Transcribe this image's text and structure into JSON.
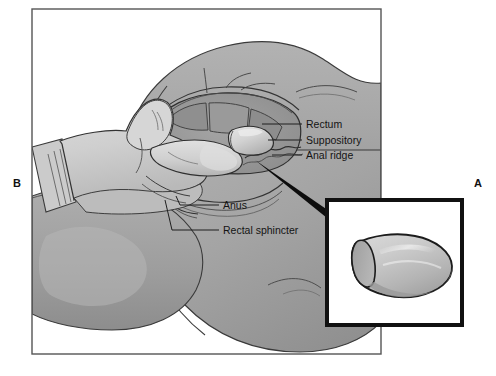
{
  "figure": {
    "type": "medical-illustration",
    "panels": [
      {
        "id": "A",
        "letter": "A",
        "position": "right",
        "content": "suppository-closeup-inset"
      },
      {
        "id": "B",
        "letter": "B",
        "position": "left",
        "content": "insertion-scene"
      }
    ],
    "callouts": [
      {
        "id": "rectum",
        "label": "Rectum",
        "leader_x1": 262,
        "leader_x2": 302,
        "leader_y": 124,
        "text_x": 306,
        "text_y": 128
      },
      {
        "id": "suppository",
        "label": "Suppository",
        "leader_x1": 268,
        "leader_x2": 302,
        "leader_y": 140,
        "text_x": 306,
        "text_y": 144
      },
      {
        "id": "anal-ridge",
        "label": "Anal ridge",
        "leader_x1": 272,
        "leader_x2": 302,
        "leader_y": 155,
        "text_x": 306,
        "text_y": 159
      },
      {
        "id": "anus",
        "label": "Anus",
        "leader_x1": 176,
        "leader_x2": 219,
        "leader_y": 205,
        "text_x": 223,
        "text_y": 209
      },
      {
        "id": "rectal-sphincter",
        "label": "Rectal sphincter",
        "leader_x1": 165,
        "leader_x2": 219,
        "leader_y": 230,
        "text_x": 223,
        "text_y": 234
      }
    ],
    "colors": {
      "page_background": "#ffffff",
      "frame_stroke": "#555555",
      "body_midtone": "#a9a9a9",
      "body_shadow": "#949494",
      "body_deep_shadow": "#868686",
      "body_highlight": "#bcbcbc",
      "rectum_cavity": "#9b9b9b",
      "rectum_fold": "#8e8e8e",
      "glove_light": "#d2d2d2",
      "glove_shadow": "#bdbdbd",
      "suppository_light": "#d8d8d8",
      "suppository_shadow": "#a6a6a6",
      "inset_border": "#111111",
      "inset_fill": "#ffffff",
      "pointer_wedge": "#0d0d0d",
      "ink_line": "#2b2b2b",
      "label_text": "#141414"
    },
    "geometry": {
      "outer_frame": {
        "x": 32,
        "y": 9,
        "width": 349,
        "height": 345
      },
      "inset_frame": {
        "x": 325,
        "y": 198,
        "width": 139,
        "height": 129
      },
      "panel_letter_b": {
        "x": 13,
        "y": 187
      },
      "panel_letter_a": {
        "x": 474,
        "y": 187
      }
    }
  }
}
